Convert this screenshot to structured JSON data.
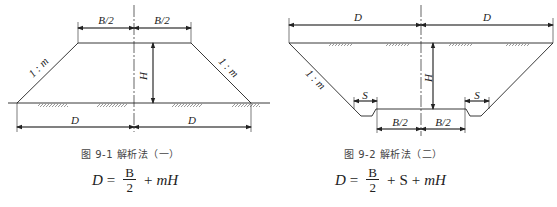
{
  "figure1": {
    "caption": "图 9-1  解析法（一）",
    "labels": {
      "half_width_left": "B/2",
      "half_width_right": "B/2",
      "height": "H",
      "slope": "1 : m",
      "distance_left": "D",
      "distance_right": "D"
    },
    "formula": {
      "lhs": "D",
      "eq": "=",
      "num": "B",
      "den": "2",
      "op1": "+",
      "term1": "mH"
    }
  },
  "figure2": {
    "caption": "图 9-2  解析法（二）",
    "labels": {
      "distance_left": "D",
      "distance_right": "D",
      "height": "H",
      "slope": "1 : m",
      "ditch_left": "S",
      "ditch_right": "S",
      "half_width_left": "B/2",
      "half_width_right": "B/2"
    },
    "formula": {
      "lhs": "D",
      "eq": "=",
      "num": "B",
      "den": "2",
      "op1": "+",
      "term1": "S",
      "op2": "+",
      "term2": "mH"
    }
  }
}
